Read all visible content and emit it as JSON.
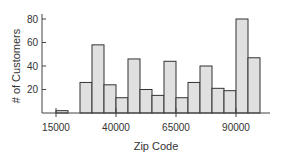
{
  "chart_data": {
    "type": "bar",
    "title": "",
    "xlabel": "Zip Code",
    "ylabel": "# of Customers",
    "bin_width": 5000,
    "bins_start": [
      15000,
      20000,
      25000,
      30000,
      35000,
      40000,
      45000,
      50000,
      55000,
      60000,
      65000,
      70000,
      75000,
      80000,
      85000,
      90000,
      95000
    ],
    "values": [
      2,
      0,
      26,
      58,
      24,
      13,
      46,
      20,
      15,
      44,
      13,
      26,
      40,
      21,
      19,
      80,
      47
    ],
    "xticks": [
      15000,
      40000,
      65000,
      90000
    ],
    "xtick_labels": [
      "15000",
      "40000",
      "65000",
      "90000"
    ],
    "yticks": [
      20,
      40,
      60,
      80
    ],
    "ytick_labels": [
      "20",
      "40",
      "60",
      "80"
    ],
    "xlim": [
      12000,
      107000
    ],
    "ylim": [
      0,
      85
    ],
    "grid": false,
    "bar_fill": "#e0e0e0",
    "bar_stroke": "#333333"
  }
}
